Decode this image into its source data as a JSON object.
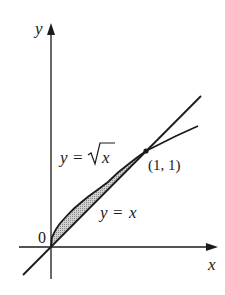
{
  "diagram": {
    "type": "area-between-curves",
    "axes": {
      "x_label": "x",
      "y_label": "y",
      "origin_label": "0"
    },
    "curves": [
      {
        "name": "sqrt",
        "label_lhs": "y",
        "label_eq": "=",
        "label_rhs": "x",
        "label_full": "y = √x"
      },
      {
        "name": "line",
        "label_lhs": "y",
        "label_eq": "=",
        "label_rhs": "x",
        "label_full": "y = x"
      }
    ],
    "intersection": {
      "label": "(1, 1)",
      "x": 1,
      "y": 1
    },
    "shaded_region": {
      "between": [
        "y = √x",
        "y = x"
      ],
      "x_from": 0,
      "x_to": 1
    },
    "colors": {
      "stroke": "#1a1a1a",
      "shade": "#b8b8b8"
    }
  }
}
